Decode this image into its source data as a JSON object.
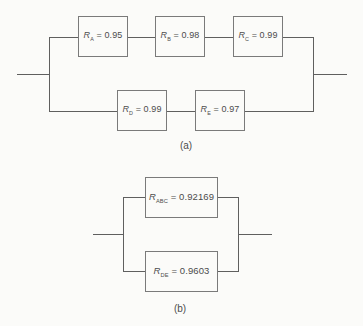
{
  "a": {
    "label": "(a)",
    "blocks": [
      {
        "symbol": "R",
        "sub": "A",
        "eq": " = 0.95"
      },
      {
        "symbol": "R",
        "sub": "B",
        "eq": " = 0.98"
      },
      {
        "symbol": "R",
        "sub": "C",
        "eq": " = 0.99"
      },
      {
        "symbol": "R",
        "sub": "D",
        "eq": " = 0.99"
      },
      {
        "symbol": "R",
        "sub": "E",
        "eq": " = 0.97"
      }
    ]
  },
  "b": {
    "label": "(b)",
    "blocks": [
      {
        "symbol": "R",
        "sub": "ABC",
        "eq": " = 0.92169"
      },
      {
        "symbol": "R",
        "sub": "DE",
        "eq": " = 0.9603"
      }
    ]
  },
  "colors": {
    "line": "#5f5f5f",
    "box_border": "#7a7a7a",
    "text": "#4c4c4c",
    "background": "#fbfbf9"
  }
}
